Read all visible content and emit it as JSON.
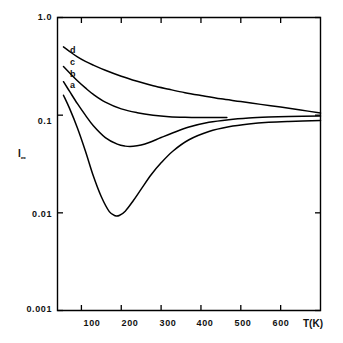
{
  "chart_data": {
    "type": "line",
    "title": "",
    "xlabel": "T(K)",
    "ylabel": "I∞",
    "ylabel_base": "I",
    "ylabel_sub": "∞",
    "xscale": "linear",
    "yscale": "log",
    "xlim": [
      40,
      700
    ],
    "ylim": [
      0.001,
      1.0
    ],
    "grid": false,
    "legend": "inline-curve-labels",
    "xticks": [
      100,
      200,
      300,
      400,
      500,
      600
    ],
    "xtick_labels": [
      "100",
      "200",
      "300",
      "400",
      "500",
      "600"
    ],
    "yticks": [
      1.0,
      0.1,
      0.01,
      0.001
    ],
    "ytick_labels": [
      "1.0",
      "0.1",
      "0.01",
      "0.001"
    ],
    "line_color": "#000000",
    "frame_color": "#000000",
    "background_color": "#ffffff",
    "series": [
      {
        "name": "d",
        "label": "d",
        "x": [
          55,
          70,
          90,
          110,
          130,
          160,
          200,
          240,
          280,
          320,
          360,
          400,
          450,
          500,
          550,
          600,
          650,
          700
        ],
        "values": [
          0.5,
          0.45,
          0.395,
          0.355,
          0.325,
          0.288,
          0.25,
          0.222,
          0.2,
          0.184,
          0.17,
          0.159,
          0.147,
          0.138,
          0.129,
          0.121,
          0.113,
          0.105
        ]
      },
      {
        "name": "c",
        "label": "c",
        "x": [
          55,
          70,
          90,
          110,
          130,
          160,
          200,
          240,
          280,
          320,
          360,
          400,
          440,
          465
        ],
        "values": [
          0.315,
          0.272,
          0.225,
          0.19,
          0.163,
          0.136,
          0.116,
          0.106,
          0.1,
          0.0965,
          0.095,
          0.0945,
          0.0945,
          0.0948
        ]
      },
      {
        "name": "b",
        "label": "b",
        "x": [
          55,
          70,
          90,
          110,
          130,
          160,
          190,
          210,
          230,
          250,
          270,
          300,
          330,
          370,
          420,
          470,
          520,
          570,
          620,
          700
        ],
        "values": [
          0.22,
          0.176,
          0.131,
          0.1,
          0.078,
          0.059,
          0.0505,
          0.0482,
          0.048,
          0.0495,
          0.0525,
          0.059,
          0.066,
          0.0755,
          0.0845,
          0.09,
          0.0935,
          0.0955,
          0.0968,
          0.098
        ]
      },
      {
        "name": "a",
        "label": "a",
        "x": [
          55,
          70,
          90,
          110,
          130,
          150,
          170,
          185,
          195,
          210,
          230,
          250,
          275,
          300,
          330,
          370,
          420,
          470,
          520,
          570,
          620,
          700
        ],
        "values": [
          0.16,
          0.118,
          0.074,
          0.043,
          0.0238,
          0.0146,
          0.0103,
          0.00935,
          0.0094,
          0.0104,
          0.0133,
          0.0175,
          0.0245,
          0.0325,
          0.043,
          0.056,
          0.068,
          0.076,
          0.0812,
          0.0845,
          0.0862,
          0.088
        ]
      }
    ],
    "annotations": [
      {
        "text": "d",
        "series": "d"
      },
      {
        "text": "c",
        "series": "c"
      },
      {
        "text": "b",
        "series": "b"
      },
      {
        "text": "a",
        "series": "a"
      }
    ]
  }
}
